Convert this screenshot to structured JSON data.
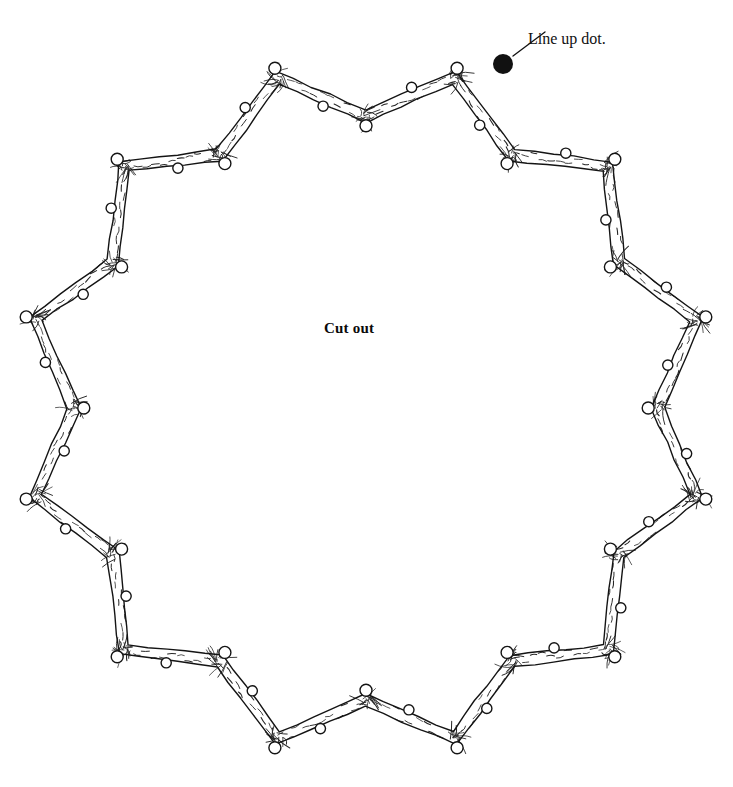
{
  "diagram": {
    "type": "woodworking-cutting-pattern",
    "title_text": "",
    "background_color": "#ffffff",
    "ink_color": "#1a1a1a",
    "canvas": {
      "width": 733,
      "height": 787
    }
  },
  "labels": {
    "center_label": "Cut out",
    "center_label_position": {
      "x": 364,
      "y": 330
    },
    "callout_label": "Line up dot.",
    "callout_label_position": {
      "x": 528,
      "y": 30
    }
  },
  "line_up_dot": {
    "name": "line-up-dot",
    "center_x": 503,
    "center_y": 64,
    "radius": 10,
    "fill": "#111111"
  },
  "leader_line": {
    "from_x": 513,
    "from_y": 56,
    "to_x": 545,
    "to_y": 32
  },
  "ring": {
    "description": "Twelve-point star ring of interlocking wood-grain puzzle segments",
    "center_x": 366,
    "center_y": 408,
    "outer_point_count": 12,
    "outer_radius": 342,
    "inner_radius": 292,
    "band_thickness": 13,
    "knob_radius": 6,
    "grain_stroke_color": "#262626",
    "outline_stroke_color": "#141414",
    "outline_stroke_width": 1.4
  },
  "vertices": {
    "outer_sample": [
      {
        "x": 503,
        "y": 64
      },
      {
        "x": 230,
        "y": 62
      },
      {
        "x": 33,
        "y": 262
      },
      {
        "x": 33,
        "y": 555
      },
      {
        "x": 232,
        "y": 755
      },
      {
        "x": 505,
        "y": 755
      },
      {
        "x": 700,
        "y": 262
      }
    ],
    "inner_sample": [
      {
        "x": 365,
        "y": 95
      },
      {
        "x": 592,
        "y": 185
      },
      {
        "x": 138,
        "y": 185
      }
    ]
  }
}
